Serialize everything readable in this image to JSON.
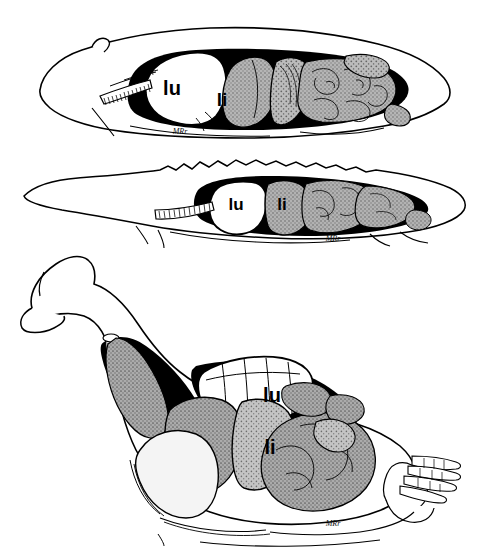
{
  "figure": {
    "background_color": "#ffffff",
    "ink_color": "#000000",
    "organ_gray": "#a8a8a8",
    "organ_gray_light": "#c9c9c9",
    "organ_gray_pale": "#efefef",
    "width": 478,
    "height": 547
  },
  "panels": [
    {
      "id": "panel-mammal",
      "name": "mammal-lateral-view",
      "labels": [
        {
          "key": "lu",
          "text": "lu",
          "x": 172,
          "y": 95,
          "size": 20
        },
        {
          "key": "li",
          "text": "li",
          "x": 222,
          "y": 106,
          "size": 19
        }
      ],
      "signature": {
        "text": "MRr",
        "x": 180,
        "y": 134,
        "size": 8
      }
    },
    {
      "id": "panel-reptile",
      "name": "reptile-lateral-view",
      "labels": [
        {
          "key": "lu",
          "text": "lu",
          "x": 232,
          "y": 205,
          "size": 17
        },
        {
          "key": "li",
          "text": "li",
          "x": 275,
          "y": 205,
          "size": 17
        }
      ],
      "signature": {
        "text": "MRr",
        "x": 330,
        "y": 238,
        "size": 8
      }
    },
    {
      "id": "panel-bird",
      "name": "bird-lateral-view",
      "labels": [
        {
          "key": "lu",
          "text": "lu",
          "x": 263,
          "y": 396,
          "size": 20
        },
        {
          "key": "li",
          "text": "li",
          "x": 268,
          "y": 452,
          "size": 20
        }
      ],
      "signature": {
        "text": "MRr",
        "x": 330,
        "y": 522,
        "size": 8
      }
    }
  ],
  "legend_keys": {
    "lu": "lung",
    "li": "liver"
  }
}
